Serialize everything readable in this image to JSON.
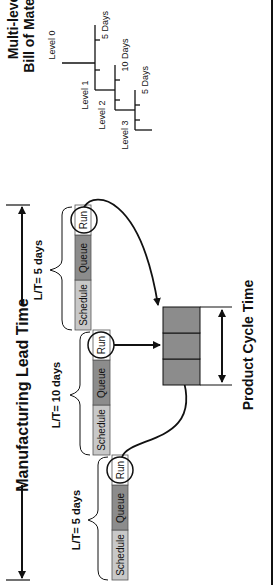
{
  "title": {
    "manufacturing_lead_time": "Manufacturing Lead Time",
    "product_cycle_time": "Product Cycle Time"
  },
  "bom": {
    "title_line1": "Multi-level",
    "title_line2": "Bill of Material",
    "levels": [
      "Level 0",
      "Level 1",
      "Level 2",
      "Level 3"
    ],
    "durations": [
      "5 Days",
      "10 Days",
      "5 Days"
    ]
  },
  "stages": [
    {
      "lead_time": "L/T= 5 days",
      "segments": [
        "Schedule",
        "Queue",
        "Run"
      ]
    },
    {
      "lead_time": "L/T= 10 days",
      "segments": [
        "Schedule",
        "Queue",
        "Run"
      ]
    },
    {
      "lead_time": "L/T= 5 days",
      "segments": [
        "Schedule",
        "Queue",
        "Run"
      ]
    }
  ],
  "colors": {
    "schedule": "#c8c8c8",
    "queue": "#8c8c8c",
    "run": "#ffffff",
    "cycle_box": "#8c8c8c",
    "line": "#111111"
  }
}
